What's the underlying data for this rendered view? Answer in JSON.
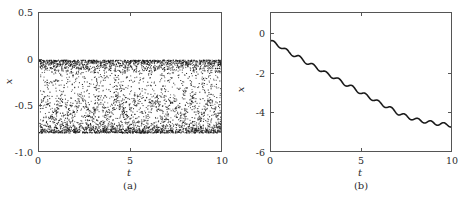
{
  "figure": {
    "background": "#ffffff",
    "axis_color": "#555555",
    "data_color": "#1a1a1a"
  },
  "panels": [
    {
      "id": "a",
      "subcaption": "(a)",
      "xlabel": "t",
      "ylabel": "x",
      "xticks": [
        "0",
        "5",
        "10"
      ],
      "yticks": [
        "0.5",
        "0",
        "-0.5",
        "-1.0"
      ]
    },
    {
      "id": "b",
      "subcaption": "(b)",
      "xlabel": "t",
      "ylabel": "x",
      "xticks": [
        "0",
        "5",
        "10"
      ],
      "yticks": [
        "0",
        "-2",
        "-4",
        "-6"
      ]
    }
  ],
  "chart_data": [
    {
      "type": "scatter",
      "title": "",
      "xlabel": "t",
      "ylabel": "x",
      "xlim": [
        0,
        10
      ],
      "ylim": [
        -1.0,
        0.5
      ],
      "xticks": [
        0,
        5,
        10
      ],
      "yticks": [
        0.5,
        0,
        -0.5,
        -1.0
      ],
      "grid": false,
      "legend": "none",
      "marker": "dot",
      "description": "Dense stochastic scatter cloud filling the band between about x = -0.78 and x = 0, with high-density edges at the top (x near 0) and bottom (x near -0.75), sparser interior, and a faint periodic banding near x = -0.5.",
      "n_points": 4200,
      "band_top": 0.0,
      "band_bottom": -0.78,
      "interior_density": 0.45,
      "edge_density": 1.0,
      "periodic_band_center": -0.52,
      "periodic_band_period": 1.0
    },
    {
      "type": "line",
      "title": "",
      "xlabel": "t",
      "ylabel": "x",
      "xlim": [
        0,
        10
      ],
      "ylim": [
        -6,
        1.05
      ],
      "xticks": [
        0,
        5,
        10
      ],
      "yticks": [
        0,
        -2,
        -4,
        -6
      ],
      "grid": false,
      "legend": "none",
      "linewidth": 1.6,
      "description": "Monotonically decreasing staircase-like curve with small periodic ripples superimposed on a linear downward drift.",
      "x": [
        0.0,
        0.5,
        1.0,
        1.5,
        2.0,
        2.5,
        3.0,
        3.5,
        4.0,
        4.5,
        5.0,
        5.5,
        6.0,
        6.5,
        7.0,
        7.5,
        8.0,
        8.5,
        9.0,
        9.5,
        10.0
      ],
      "y": [
        -0.38,
        -0.62,
        -0.95,
        -1.16,
        -1.46,
        -1.69,
        -1.98,
        -2.2,
        -2.49,
        -2.71,
        -3.0,
        -3.23,
        -3.5,
        -3.72,
        -4.0,
        -4.18,
        -4.33,
        -4.42,
        -4.5,
        -4.56,
        -4.62
      ]
    }
  ]
}
